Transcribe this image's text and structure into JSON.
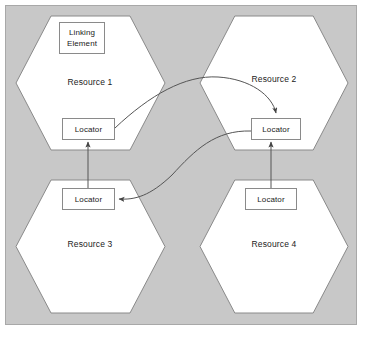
{
  "diagram": {
    "type": "xlink-extended-link-diagram",
    "panel": {
      "background_color": "#c8c8c8",
      "border_color": "#a8a8a8"
    },
    "shape_style": {
      "hexagon_fill": "#ffffff",
      "hexagon_stroke": "#8a8a8a",
      "box_fill": "#ffffff",
      "box_stroke": "#8a8a8a",
      "arrow_color": "#555555"
    },
    "resources": [
      {
        "id": "resource-1",
        "label": "Resource 1",
        "hexagon": {
          "x": 16,
          "y": 16,
          "width": 149,
          "height": 134
        },
        "label_pos": {
          "x": 90,
          "y": 83
        },
        "boxes": [
          {
            "id": "linking-element",
            "label": "Linking\nElement",
            "x": 59,
            "y": 22,
            "width": 46,
            "height": 32
          },
          {
            "id": "locator-1",
            "label": "Locator",
            "x": 62,
            "y": 118,
            "width": 53,
            "height": 22
          }
        ]
      },
      {
        "id": "resource-2",
        "label": "Resource 2",
        "hexagon": {
          "x": 200,
          "y": 16,
          "width": 148,
          "height": 134
        },
        "label_pos": {
          "x": 274,
          "y": 80
        },
        "boxes": [
          {
            "id": "locator-2",
            "label": "Locator",
            "x": 251,
            "y": 118,
            "width": 50,
            "height": 22
          }
        ]
      },
      {
        "id": "resource-3",
        "label": "Resource 3",
        "hexagon": {
          "x": 16,
          "y": 180,
          "width": 149,
          "height": 133
        },
        "label_pos": {
          "x": 90,
          "y": 245
        },
        "boxes": [
          {
            "id": "locator-3",
            "label": "Locator",
            "x": 62,
            "y": 188,
            "width": 53,
            "height": 22
          }
        ]
      },
      {
        "id": "resource-4",
        "label": "Resource 4",
        "hexagon": {
          "x": 200,
          "y": 180,
          "width": 148,
          "height": 133
        },
        "label_pos": {
          "x": 274,
          "y": 245
        },
        "boxes": [
          {
            "id": "locator-4",
            "label": "Locator",
            "x": 245,
            "y": 188,
            "width": 52,
            "height": 22
          }
        ]
      }
    ],
    "connectors": [
      {
        "id": "arc-locator1-to-locator2",
        "from": "locator-1",
        "to": "locator-2",
        "kind": "curved-arrow",
        "path": "M 115 128 C 150 95 185 75 218 77 C 250 79 272 95 276 113",
        "arrowhead_at": "end"
      },
      {
        "id": "arc-locator2-to-locator3",
        "from": "locator-2",
        "to": "locator-3",
        "kind": "curved-arrow",
        "path": "M 251 131 C 215 130 195 150 172 175 C 150 196 135 200 119 199",
        "arrowhead_at": "end"
      },
      {
        "id": "line-locator3-to-locator1",
        "from": "locator-3",
        "to": "locator-1",
        "kind": "straight-arrow",
        "path": "M 88 188 L 88 142",
        "arrowhead_at": "end"
      },
      {
        "id": "line-locator4-to-locator2",
        "from": "locator-4",
        "to": "locator-2",
        "kind": "straight-arrow",
        "path": "M 271 188 L 271 142",
        "arrowhead_at": "end"
      }
    ]
  }
}
